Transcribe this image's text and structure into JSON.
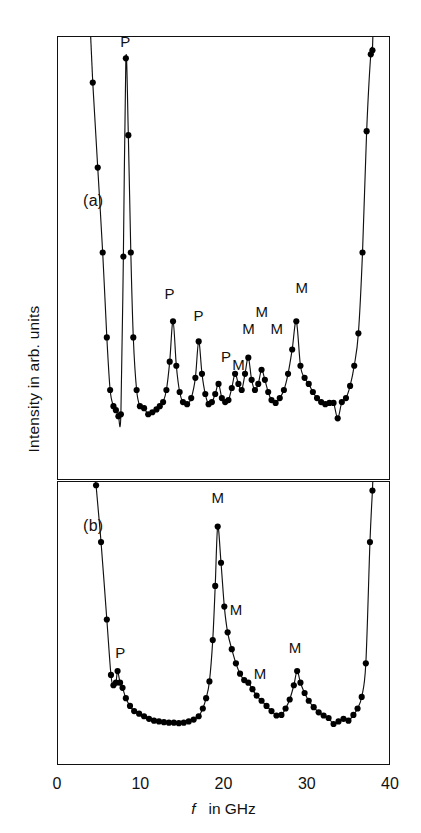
{
  "figure": {
    "axes": {
      "x_label_italic": "f",
      "x_label_rest": "in GHz",
      "y_label": "Intensity in arb. units",
      "x_ticks": [
        0,
        10,
        20,
        30,
        40
      ],
      "x_tick_labels": [
        "0",
        "10",
        "20",
        "30",
        "40"
      ]
    },
    "panel_a_letter": "(a)",
    "panel_b_letter": "(b)",
    "colors": {
      "line": "#111111",
      "marker": "#000000",
      "axis": "#111111",
      "background": "#ffffff"
    }
  },
  "chart_data": [
    {
      "type": "line",
      "id": "panel-a",
      "title": "(a)",
      "xlabel": "f in GHz",
      "ylabel": "Intensity in arb. units",
      "xlim": [
        0,
        40
      ],
      "ylim": [
        0,
        1
      ],
      "grid": false,
      "legend": "none",
      "markers": "filled-circle",
      "x": [
        4.2,
        4.8,
        5.4,
        5.9,
        6.3,
        6.7,
        7.0,
        7.3,
        7.6,
        7.9,
        8.2,
        8.5,
        8.8,
        9.1,
        9.5,
        9.9,
        10.4,
        10.9,
        11.4,
        11.9,
        12.3,
        12.7,
        13.1,
        13.5,
        13.9,
        14.3,
        14.7,
        15.1,
        15.6,
        16.1,
        16.6,
        17.0,
        17.4,
        17.8,
        18.2,
        18.6,
        19.0,
        19.4,
        19.8,
        20.2,
        20.6,
        21.0,
        21.4,
        21.8,
        22.2,
        22.6,
        23.0,
        23.4,
        23.8,
        24.2,
        24.6,
        25.0,
        25.4,
        25.8,
        26.3,
        26.8,
        27.3,
        27.8,
        28.3,
        28.8,
        29.3,
        29.8,
        30.3,
        30.8,
        31.3,
        31.8,
        32.3,
        32.8,
        33.3,
        33.8,
        34.3,
        34.8,
        35.3,
        35.8,
        36.3,
        36.8,
        37.3,
        37.8,
        38.0
      ],
      "y": [
        0.92,
        0.71,
        0.5,
        0.29,
        0.16,
        0.12,
        0.11,
        0.095,
        0.1,
        0.49,
        0.98,
        0.79,
        0.5,
        0.29,
        0.16,
        0.12,
        0.115,
        0.1,
        0.105,
        0.112,
        0.12,
        0.13,
        0.16,
        0.23,
        0.33,
        0.22,
        0.155,
        0.13,
        0.125,
        0.14,
        0.19,
        0.28,
        0.2,
        0.15,
        0.125,
        0.13,
        0.15,
        0.175,
        0.14,
        0.13,
        0.135,
        0.165,
        0.2,
        0.175,
        0.16,
        0.2,
        0.24,
        0.185,
        0.16,
        0.175,
        0.21,
        0.185,
        0.155,
        0.135,
        0.128,
        0.14,
        0.16,
        0.2,
        0.26,
        0.33,
        0.22,
        0.19,
        0.175,
        0.155,
        0.14,
        0.13,
        0.125,
        0.128,
        0.128,
        0.09,
        0.13,
        0.14,
        0.17,
        0.22,
        0.3,
        0.5,
        0.8,
        0.99,
        1.0
      ],
      "annotations": [
        {
          "label": "P",
          "x": 8.2,
          "y": 1.02
        },
        {
          "label": "P",
          "x": 13.5,
          "y": 0.4
        },
        {
          "label": "P",
          "x": 17.0,
          "y": 0.345
        },
        {
          "label": "P",
          "x": 20.3,
          "y": 0.245
        },
        {
          "label": "M",
          "x": 21.8,
          "y": 0.225
        },
        {
          "label": "M",
          "x": 23.0,
          "y": 0.315
        },
        {
          "label": "M",
          "x": 24.6,
          "y": 0.355
        },
        {
          "label": "M",
          "x": 26.4,
          "y": 0.315
        },
        {
          "label": "M",
          "x": 29.4,
          "y": 0.415
        }
      ]
    },
    {
      "type": "line",
      "id": "panel-b",
      "title": "(b)",
      "xlabel": "f in GHz",
      "ylabel": "Intensity in arb. units",
      "xlim": [
        0,
        40
      ],
      "ylim": [
        0,
        1
      ],
      "grid": false,
      "legend": "none",
      "markers": "filled-circle",
      "x": [
        4.6,
        5.2,
        5.9,
        6.4,
        6.7,
        7.0,
        7.2,
        7.5,
        7.8,
        8.2,
        8.7,
        9.2,
        9.8,
        10.4,
        11.0,
        11.6,
        12.2,
        12.8,
        13.4,
        14.0,
        14.6,
        15.2,
        15.8,
        16.4,
        17.0,
        17.5,
        17.9,
        18.3,
        18.7,
        19.0,
        19.3,
        19.7,
        20.1,
        20.5,
        21.0,
        21.5,
        22.0,
        22.5,
        23.0,
        23.5,
        24.0,
        24.6,
        25.2,
        25.8,
        26.4,
        27.0,
        27.5,
        28.0,
        28.5,
        28.9,
        29.3,
        29.8,
        30.3,
        30.9,
        31.5,
        32.1,
        32.7,
        33.3,
        33.9,
        34.5,
        35.1,
        35.7,
        36.2,
        36.7,
        37.2,
        37.7,
        38.0
      ],
      "y": [
        1.02,
        0.8,
        0.5,
        0.285,
        0.245,
        0.255,
        0.3,
        0.255,
        0.235,
        0.195,
        0.165,
        0.145,
        0.135,
        0.125,
        0.115,
        0.108,
        0.105,
        0.102,
        0.1,
        0.1,
        0.098,
        0.1,
        0.105,
        0.112,
        0.125,
        0.155,
        0.195,
        0.26,
        0.42,
        0.63,
        0.86,
        0.72,
        0.55,
        0.45,
        0.385,
        0.33,
        0.29,
        0.265,
        0.255,
        0.23,
        0.205,
        0.185,
        0.165,
        0.145,
        0.128,
        0.13,
        0.155,
        0.19,
        0.245,
        0.3,
        0.255,
        0.215,
        0.185,
        0.16,
        0.14,
        0.128,
        0.118,
        0.095,
        0.105,
        0.115,
        0.108,
        0.13,
        0.155,
        0.2,
        0.33,
        0.8,
        1.0
      ],
      "annotations": [
        {
          "label": "P",
          "x": 7.6,
          "y": 0.375
        },
        {
          "label": "M",
          "x": 19.3,
          "y": 0.97
        },
        {
          "label": "M",
          "x": 21.5,
          "y": 0.54
        },
        {
          "label": "M",
          "x": 24.4,
          "y": 0.295
        },
        {
          "label": "M",
          "x": 28.6,
          "y": 0.395
        }
      ]
    }
  ]
}
